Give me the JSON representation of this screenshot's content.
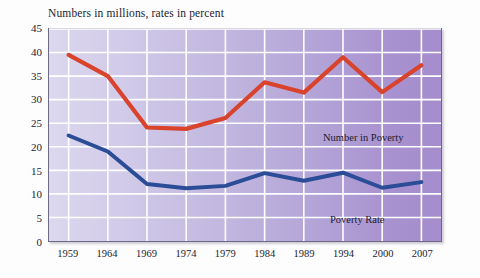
{
  "chart_data": {
    "type": "line",
    "title": "Numbers in millions, rates in percent",
    "xlabel": "",
    "ylabel": "",
    "ylim": [
      0,
      45
    ],
    "yticks": [
      0,
      5,
      10,
      15,
      20,
      25,
      30,
      35,
      40,
      45
    ],
    "grid": true,
    "legend_position": "inline-annotations",
    "categories": [
      "1959",
      "1964",
      "1969",
      "1974",
      "1979",
      "1984",
      "1989",
      "1994",
      "2000",
      "2007"
    ],
    "series": [
      {
        "name": "Number in Poverty",
        "color": "#d9422b",
        "values": [
          39.5,
          35.0,
          24.1,
          23.8,
          26.1,
          33.7,
          31.5,
          39.0,
          31.6,
          37.3
        ]
      },
      {
        "name": "Poverty Rate",
        "color": "#2b4c96",
        "values": [
          22.4,
          19.0,
          12.1,
          11.2,
          11.7,
          14.4,
          12.8,
          14.5,
          11.3,
          12.5
        ]
      }
    ],
    "annotations": [
      {
        "text": "Number in Poverty",
        "series": "Number in Poverty"
      },
      {
        "text": "Poverty Rate",
        "series": "Poverty Rate"
      }
    ]
  },
  "colors": {
    "plot_background_left": "#dcd8ef",
    "plot_background_right": "#a58dcd",
    "gridline": "#ffffff",
    "plot_border": "#6e6a86",
    "page_background": "#fdfdfd",
    "text": "#23232f",
    "series_number_in_poverty": "#d9422b",
    "series_poverty_rate": "#2b4c96"
  }
}
